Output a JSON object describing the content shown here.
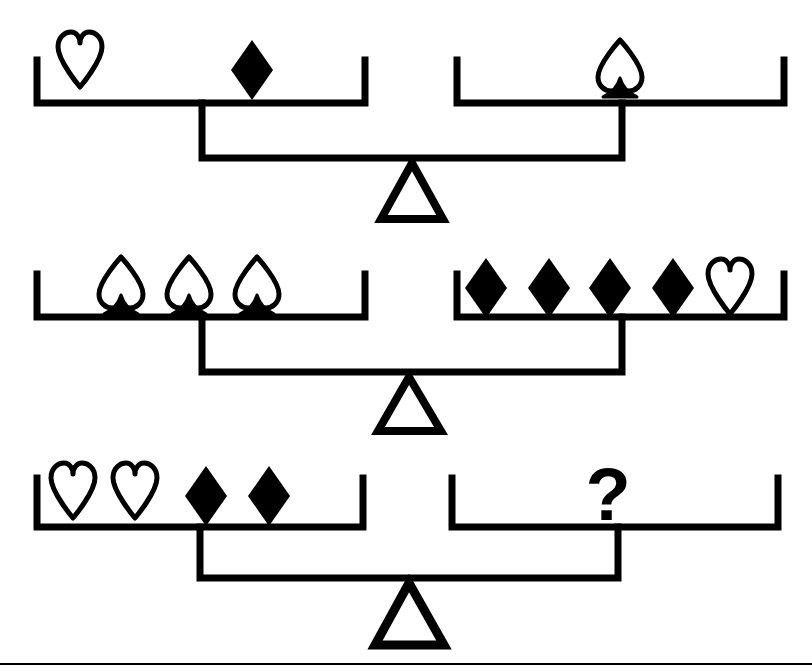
{
  "figure": {
    "kind": "balance-scale-logic-puzzle",
    "background_color": "#ffffff",
    "ink_color": "#000000",
    "width": 812,
    "height": 671,
    "unknown_symbol": "?",
    "footer_rule": true
  },
  "legend": {
    "heart": {
      "name": "heart",
      "style": "outline",
      "fill": "#ffffff",
      "stroke": "#000000"
    },
    "diamond": {
      "name": "diamond",
      "style": "solid",
      "fill": "#000000",
      "stroke": "#000000"
    },
    "spade": {
      "name": "spade",
      "style": "outline",
      "fill": "#ffffff",
      "stroke": "#000000"
    },
    "fulcrum": {
      "name": "triangle",
      "style": "outline",
      "fill": "#ffffff",
      "stroke": "#000000"
    }
  },
  "scales": [
    {
      "id": "scale-1",
      "label": "Balance 1",
      "state": "balanced",
      "left_pan": {
        "label": "left pan",
        "items": [
          "heart",
          "diamond"
        ],
        "counts": {
          "heart": 1,
          "diamond": 1,
          "spade": 0
        },
        "summary": "1 heart + 1 diamond"
      },
      "right_pan": {
        "label": "right pan",
        "items": [
          "spade"
        ],
        "counts": {
          "heart": 0,
          "diamond": 0,
          "spade": 1
        },
        "summary": "1 spade"
      },
      "equation": "heart + diamond = spade"
    },
    {
      "id": "scale-2",
      "label": "Balance 2",
      "state": "balanced",
      "left_pan": {
        "label": "left pan",
        "items": [
          "spade",
          "spade",
          "spade"
        ],
        "counts": {
          "heart": 0,
          "diamond": 0,
          "spade": 3
        },
        "summary": "3 spades"
      },
      "right_pan": {
        "label": "right pan",
        "items": [
          "diamond",
          "diamond",
          "diamond",
          "diamond",
          "heart"
        ],
        "counts": {
          "heart": 1,
          "diamond": 4,
          "spade": 0
        },
        "summary": "4 diamonds + 1 heart"
      },
      "equation": "3 spades = 4 diamonds + 1 heart"
    },
    {
      "id": "scale-3",
      "label": "Balance 3",
      "state": "balanced",
      "left_pan": {
        "label": "left pan",
        "items": [
          "heart",
          "heart",
          "diamond",
          "diamond"
        ],
        "counts": {
          "heart": 2,
          "diamond": 2,
          "spade": 0
        },
        "summary": "2 hearts + 2 diamonds"
      },
      "right_pan": {
        "label": "right pan",
        "items": [
          "question"
        ],
        "counts": {
          "heart": 0,
          "diamond": 0,
          "spade": 0
        },
        "summary": "unknown",
        "unknown_label": "?"
      },
      "equation": "2 hearts + 2 diamonds = ?"
    }
  ]
}
